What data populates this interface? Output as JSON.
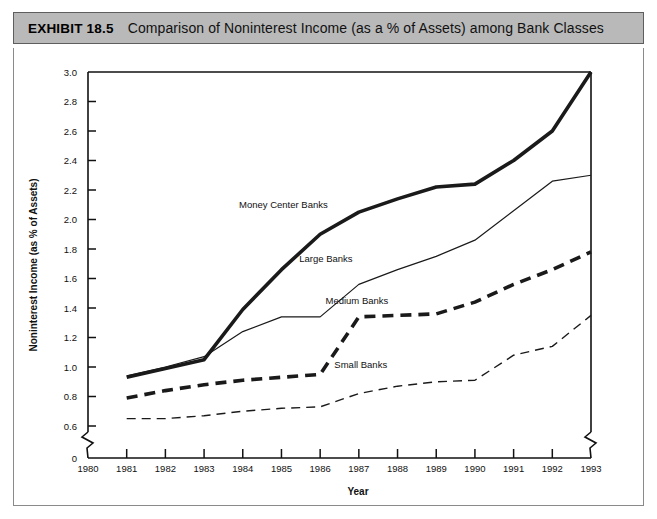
{
  "exhibit": {
    "number_label": "EXHIBIT 18.5",
    "title": "Comparison of Noninterest Income (as a % of Assets) among Bank Classes"
  },
  "chart_data": {
    "type": "line",
    "title": "Comparison of Noninterest Income (as a % of Assets) among Bank Classes",
    "xlabel": "Year",
    "ylabel": "Noninterest Income (as % of Assets)",
    "x": [
      1981,
      1982,
      1983,
      1984,
      1985,
      1986,
      1987,
      1988,
      1989,
      1990,
      1991,
      1992,
      1993
    ],
    "x_tick_labels": [
      "1980",
      "1981",
      "1982",
      "1983",
      "1984",
      "1985",
      "1986",
      "1987",
      "1988",
      "1989",
      "1990",
      "1991",
      "1992",
      "1993"
    ],
    "y_tick_labels": [
      "0",
      "0.6",
      "0.8",
      "1.0",
      "1.2",
      "1.4",
      "1.6",
      "1.8",
      "2.0",
      "2.2",
      "2.4",
      "2.6",
      "2.8",
      "3.0"
    ],
    "ylim": [
      0.6,
      3.0
    ],
    "xlim": [
      1980,
      1993
    ],
    "y_axis_break": true,
    "x_axis_break": true,
    "grid": false,
    "legend": "inline-labels",
    "series": [
      {
        "name": "Money Center Banks",
        "style": "thick-solid",
        "label_x": 1985.05,
        "label_y": 2.08,
        "values": [
          0.93,
          0.99,
          1.05,
          1.39,
          1.66,
          1.9,
          2.05,
          2.14,
          2.22,
          2.24,
          2.4,
          2.6,
          3.0
        ]
      },
      {
        "name": "Large Banks",
        "style": "thin-solid",
        "label_x": 1986.15,
        "label_y": 1.71,
        "values": [
          0.94,
          1.0,
          1.07,
          1.24,
          1.34,
          1.34,
          1.56,
          1.66,
          1.75,
          1.86,
          2.06,
          2.26,
          2.3
        ]
      },
      {
        "name": "Medium Banks",
        "style": "thick-dashed",
        "label_x": 1986.95,
        "label_y": 1.43,
        "values": [
          0.79,
          0.84,
          0.88,
          0.91,
          0.93,
          0.95,
          1.34,
          1.35,
          1.36,
          1.44,
          1.56,
          1.66,
          1.78
        ]
      },
      {
        "name": "Small Banks",
        "style": "thin-dashed",
        "label_x": 1987.05,
        "label_y": 0.99,
        "values": [
          0.65,
          0.65,
          0.67,
          0.7,
          0.72,
          0.73,
          0.82,
          0.87,
          0.9,
          0.91,
          1.08,
          1.14,
          1.35
        ]
      }
    ]
  }
}
